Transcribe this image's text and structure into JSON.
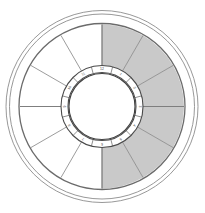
{
  "geometry": {
    "center_x": 102,
    "center_y": 106.5,
    "outer_ring_1_radius": 96,
    "outer_ring_2_radius": 92.5,
    "main_ring_radius": 83,
    "sector_outer_radius": 82,
    "inner_ring_outer_radius": 41,
    "inner_ring_inner_radius": 34,
    "hub_radius": 33,
    "sector_count": 12,
    "sector_start_angle_deg": -90
  },
  "colors": {
    "background": "#ffffff",
    "shaded_sector": "#c9c9c9",
    "unshaded_sector": "#ffffff",
    "outline_outer": "#8c8c8c",
    "outline_main": "#6b6b6b",
    "spoke": "#8a8a8a",
    "inner_ring_stroke": "#4a4a4a",
    "label_text": "#3a3a3a"
  },
  "shading": {
    "shaded_half": "right",
    "shaded_sector_indices": [
      0,
      1,
      2,
      3,
      4,
      5
    ],
    "unshaded_sector_indices": [
      6,
      7,
      8,
      9,
      10,
      11
    ]
  },
  "inner_ring": {
    "label_count": 12,
    "labels": [
      {
        "index": 0,
        "text": "12",
        "angle_deg": -90
      },
      {
        "index": 1,
        "text": "1",
        "angle_deg": -60
      },
      {
        "index": 2,
        "text": "2",
        "angle_deg": -30
      },
      {
        "index": 3,
        "text": "3",
        "angle_deg": 0
      },
      {
        "index": 4,
        "text": "4",
        "angle_deg": 30
      },
      {
        "index": 5,
        "text": "5",
        "angle_deg": 60
      },
      {
        "index": 6,
        "text": "6",
        "angle_deg": 90
      },
      {
        "index": 7,
        "text": "7",
        "angle_deg": 120
      },
      {
        "index": 8,
        "text": "8",
        "angle_deg": 150
      },
      {
        "index": 9,
        "text": "9",
        "angle_deg": 180
      },
      {
        "index": 10,
        "text": "10",
        "angle_deg": 210
      },
      {
        "index": 11,
        "text": "11",
        "angle_deg": 240
      }
    ]
  },
  "sectors": [
    {
      "index": 0,
      "start_deg": -90,
      "end_deg": -60,
      "shaded": true
    },
    {
      "index": 1,
      "start_deg": -60,
      "end_deg": -30,
      "shaded": true
    },
    {
      "index": 2,
      "start_deg": -30,
      "end_deg": 0,
      "shaded": true
    },
    {
      "index": 3,
      "start_deg": 0,
      "end_deg": 30,
      "shaded": true
    },
    {
      "index": 4,
      "start_deg": 30,
      "end_deg": 60,
      "shaded": true
    },
    {
      "index": 5,
      "start_deg": 60,
      "end_deg": 90,
      "shaded": true
    },
    {
      "index": 6,
      "start_deg": 90,
      "end_deg": 120,
      "shaded": false
    },
    {
      "index": 7,
      "start_deg": 120,
      "end_deg": 150,
      "shaded": false
    },
    {
      "index": 8,
      "start_deg": 150,
      "end_deg": 180,
      "shaded": false
    },
    {
      "index": 9,
      "start_deg": 180,
      "end_deg": 210,
      "shaded": false
    },
    {
      "index": 10,
      "start_deg": 210,
      "end_deg": 240,
      "shaded": false
    },
    {
      "index": 11,
      "start_deg": 240,
      "end_deg": 270,
      "shaded": false
    }
  ]
}
